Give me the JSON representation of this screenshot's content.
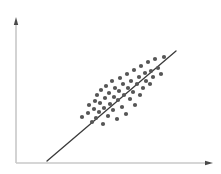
{
  "figure": {
    "title": "",
    "background_color": "#ffffff",
    "width": 221,
    "height": 174
  },
  "axes": {
    "color": "#c8c8c8",
    "line_width": 1.6,
    "origin": {
      "x": 16,
      "y": 163
    },
    "y_axis": {
      "name": "y-axis",
      "x": 16,
      "y_top": 17,
      "y_bottom": 163,
      "arrow": "up",
      "label": "",
      "ticks": [],
      "tick_labels": []
    },
    "x_axis": {
      "name": "x-axis",
      "y": 163,
      "x_left": 16,
      "x_right": 213,
      "arrow": "right",
      "label": "",
      "ticks": [],
      "tick_labels": []
    }
  },
  "trend_line": {
    "name": "regression-line",
    "color": "#3a3a3a",
    "line_width": 1.3,
    "x1": 47,
    "y1": 161,
    "x2": 176,
    "y2": 51
  },
  "points_style": {
    "color": "#565656",
    "radius": 2.1,
    "marker": "circle"
  },
  "chart_data": {
    "type": "scatter",
    "title": "",
    "xlabel": "",
    "ylabel": "",
    "xlim": [
      16,
      213
    ],
    "ylim": [
      17,
      163
    ],
    "grid": false,
    "legend": null,
    "series": [
      {
        "name": "observations",
        "color": "#565656",
        "marker": "circle",
        "n": 52,
        "points": [
          [
            82,
            117
          ],
          [
            88,
            113
          ],
          [
            89,
            105
          ],
          [
            92,
            122
          ],
          [
            94,
            109
          ],
          [
            95,
            101
          ],
          [
            96,
            118
          ],
          [
            97,
            95
          ],
          [
            99,
            112
          ],
          [
            100,
            103
          ],
          [
            101,
            90
          ],
          [
            103,
            124
          ],
          [
            104,
            108
          ],
          [
            105,
            98
          ],
          [
            106,
            86
          ],
          [
            108,
            116
          ],
          [
            109,
            93
          ],
          [
            110,
            104
          ],
          [
            112,
            81
          ],
          [
            113,
            110
          ],
          [
            114,
            97
          ],
          [
            115,
            88
          ],
          [
            117,
            119
          ],
          [
            118,
            100
          ],
          [
            119,
            91
          ],
          [
            120,
            78
          ],
          [
            122,
            107
          ],
          [
            123,
            84
          ],
          [
            124,
            95
          ],
          [
            126,
            114
          ],
          [
            127,
            74
          ],
          [
            128,
            88
          ],
          [
            130,
            99
          ],
          [
            131,
            81
          ],
          [
            133,
            92
          ],
          [
            134,
            70
          ],
          [
            135,
            105
          ],
          [
            137,
            84
          ],
          [
            139,
            77
          ],
          [
            140,
            95
          ],
          [
            141,
            66
          ],
          [
            143,
            88
          ],
          [
            145,
            73
          ],
          [
            146,
            81
          ],
          [
            148,
            62
          ],
          [
            150,
            84
          ],
          [
            151,
            71
          ],
          [
            153,
            77
          ],
          [
            155,
            59
          ],
          [
            158,
            68
          ],
          [
            161,
            74
          ],
          [
            164,
            57
          ]
        ]
      }
    ]
  }
}
